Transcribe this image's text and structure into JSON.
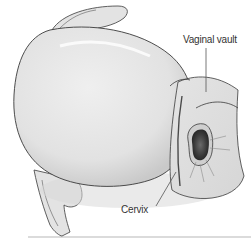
{
  "diagram": {
    "labels": [
      {
        "id": "vaginal-vault",
        "text": "Vaginal vault"
      },
      {
        "id": "cervix",
        "text": "Cervix"
      }
    ],
    "colors": {
      "background": "#ffffff",
      "tissue_light": "#e9e9e9",
      "tissue_mid": "#d2d2d2",
      "tissue_shadow": "#b5b5b5",
      "outline": "#3a3a3a",
      "os_dark": "#2f2f2f",
      "leader_line": "#555555",
      "baseline": "#c8c8c8"
    }
  }
}
